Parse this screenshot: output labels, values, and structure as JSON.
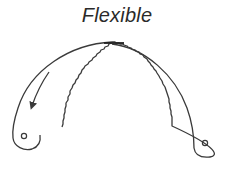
{
  "figure": {
    "title": "Flexible",
    "stroke_color": "#3a3a3a",
    "background_color": "#ffffff"
  },
  "elements": {
    "left_blade": {
      "label": "left-blade",
      "has_hole": true,
      "edge": "serrated-inner"
    },
    "right_blade": {
      "label": "right-blade",
      "has_hole": true,
      "edge": "serrated-outer"
    },
    "arrow": {
      "label": "bend-direction-arrow",
      "direction": "down-left"
    }
  }
}
